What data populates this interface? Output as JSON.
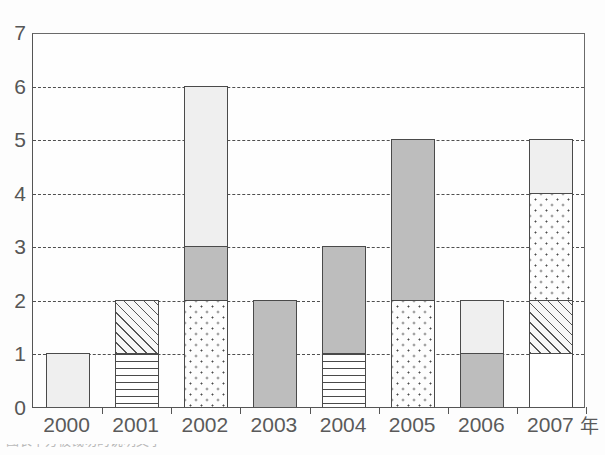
{
  "chart_data": {
    "type": "bar",
    "subtype": "stacked-bar",
    "title": "",
    "xlabel": "",
    "ylabel": "",
    "x_unit_label": "年",
    "ylim": [
      0,
      7
    ],
    "ytick_labels": [
      "0",
      "1",
      "2",
      "3",
      "4",
      "5",
      "6",
      "7"
    ],
    "ytick_values": [
      0,
      1,
      2,
      3,
      4,
      5,
      6,
      7
    ],
    "grid": true,
    "gridline_values": [
      1,
      2,
      3,
      4,
      5,
      6
    ],
    "gridline_style": "dashed",
    "legend": false,
    "legend_position": "none",
    "categories": [
      "2000",
      "2001",
      "2002",
      "2003",
      "2004",
      "2005",
      "2006",
      "2007"
    ],
    "totals": [
      1,
      2,
      6,
      2,
      3,
      5,
      2,
      5
    ],
    "series": [
      {
        "name": "blank-white",
        "pattern": "blank",
        "values": [
          0,
          0,
          0,
          0,
          0,
          0,
          0,
          1
        ]
      },
      {
        "name": "horizontal-lines",
        "pattern": "hlines",
        "values": [
          0,
          1,
          0,
          0,
          1,
          0,
          0,
          0
        ]
      },
      {
        "name": "diagonal-hatch",
        "pattern": "diag",
        "values": [
          0,
          1,
          0,
          0,
          0,
          0,
          0,
          1
        ]
      },
      {
        "name": "dotted",
        "pattern": "dots",
        "values": [
          0,
          0,
          2,
          0,
          0,
          2,
          0,
          2
        ]
      },
      {
        "name": "mid-gray",
        "pattern": "midgray",
        "values": [
          0,
          0,
          1,
          2,
          2,
          3,
          1,
          0
        ]
      },
      {
        "name": "light-gray",
        "pattern": "lightgray",
        "values": [
          1,
          0,
          3,
          0,
          0,
          0,
          1,
          1
        ]
      }
    ],
    "bars": [
      {
        "category": "2000",
        "total": 1,
        "segments": [
          {
            "pattern": "lightgray",
            "from": 0,
            "to": 1,
            "value": 1
          }
        ]
      },
      {
        "category": "2001",
        "total": 2,
        "segments": [
          {
            "pattern": "hlines",
            "from": 0,
            "to": 1,
            "value": 1
          },
          {
            "pattern": "diag",
            "from": 1,
            "to": 2,
            "value": 1
          }
        ]
      },
      {
        "category": "2002",
        "total": 6,
        "segments": [
          {
            "pattern": "dots",
            "from": 0,
            "to": 2,
            "value": 2
          },
          {
            "pattern": "midgray",
            "from": 2,
            "to": 3,
            "value": 1
          },
          {
            "pattern": "lightgray",
            "from": 3,
            "to": 6,
            "value": 3
          }
        ]
      },
      {
        "category": "2003",
        "total": 2,
        "segments": [
          {
            "pattern": "midgray",
            "from": 0,
            "to": 2,
            "value": 2
          }
        ]
      },
      {
        "category": "2004",
        "total": 3,
        "segments": [
          {
            "pattern": "hlines",
            "from": 0,
            "to": 1,
            "value": 1
          },
          {
            "pattern": "midgray",
            "from": 1,
            "to": 3,
            "value": 2
          }
        ]
      },
      {
        "category": "2005",
        "total": 5,
        "segments": [
          {
            "pattern": "dots",
            "from": 0,
            "to": 2,
            "value": 2
          },
          {
            "pattern": "midgray",
            "from": 2,
            "to": 5,
            "value": 3
          }
        ]
      },
      {
        "category": "2006",
        "total": 2,
        "segments": [
          {
            "pattern": "midgray",
            "from": 0,
            "to": 1,
            "value": 1
          },
          {
            "pattern": "lightgray",
            "from": 1,
            "to": 2,
            "value": 1
          }
        ]
      },
      {
        "category": "2007",
        "total": 5,
        "segments": [
          {
            "pattern": "blank",
            "from": 0,
            "to": 1,
            "value": 1
          },
          {
            "pattern": "diag",
            "from": 1,
            "to": 2,
            "value": 1
          },
          {
            "pattern": "dots",
            "from": 2,
            "to": 4,
            "value": 2
          },
          {
            "pattern": "lightgray",
            "from": 4,
            "to": 5,
            "value": 1
          }
        ]
      }
    ],
    "colors": {
      "axis": "#4a4a4a",
      "gridline": "#4f4f4f",
      "blank": "#ffffff",
      "lightgray": "#efefef",
      "midgray": "#bdbdbd",
      "background": "#fdfdfd",
      "text": "#565656"
    }
  },
  "caption": {
    "cropped_text": "图表下方被裁切的说明文字"
  }
}
